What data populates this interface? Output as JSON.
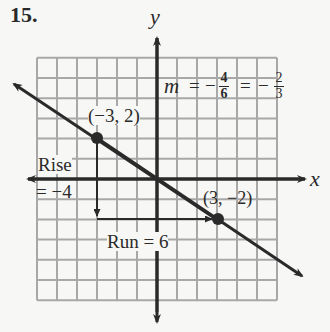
{
  "problem_number": "15.",
  "axes": {
    "x_label": "x",
    "y_label": "y"
  },
  "points": [
    {
      "label": "(−3, 2)",
      "x": -3,
      "y": 2
    },
    {
      "label": "(3, −2)",
      "x": 3,
      "y": -2
    }
  ],
  "rise": {
    "line1": "Rise",
    "line2": "= −4"
  },
  "run": {
    "label": "Run = 6"
  },
  "slope": {
    "m": "m",
    "eq1": "=",
    "neg1": "−",
    "num1": "4",
    "den1": "6",
    "eq2": "=",
    "neg2": "−",
    "num2": "2",
    "den2": "3"
  },
  "grid": {
    "x_min": -6,
    "x_max": 6,
    "y_min": -6,
    "y_max": 6
  },
  "colors": {
    "grid": "#a8a8a8",
    "ink": "#2a2a2a",
    "background": "#f7f7f5"
  }
}
